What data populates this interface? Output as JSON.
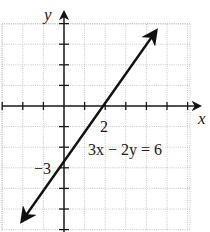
{
  "chart_data": {
    "type": "line",
    "title": "",
    "xlabel": "x",
    "ylabel": "y",
    "equation": "3x − 2y = 6",
    "series": [
      {
        "name": "3x - 2y = 6",
        "x": [
          -2.1,
          0,
          2,
          4.4
        ],
        "y": [
          -5.6,
          -3,
          0,
          3.6
        ]
      }
    ],
    "labeled_points": [
      {
        "label": "2",
        "x": 2,
        "y": 0,
        "meaning": "x-intercept"
      },
      {
        "label": "−3",
        "x": 0,
        "y": -3,
        "meaning": "y-intercept"
      }
    ],
    "xlim": [
      -3,
      6
    ],
    "ylim": [
      -6,
      4
    ],
    "grid": true,
    "grid_style": "dotted",
    "tick_spacing": 1
  },
  "labels": {
    "x_axis": "x",
    "y_axis": "y",
    "x_intercept": "2",
    "y_intercept": "−3",
    "equation": "3x − 2y = 6"
  },
  "colors": {
    "grid": "#b8b8b8",
    "axis": "#1a1a1a",
    "line": "#111111"
  }
}
